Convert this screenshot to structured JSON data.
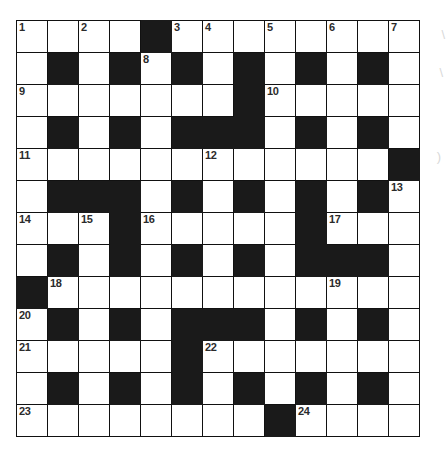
{
  "document": {
    "type": "crossword-puzzle-grid",
    "title": "Crossword Puzzle Grid",
    "rows": 13,
    "columns": 13,
    "colors": {
      "block": "#1a1a1a",
      "open": "#ffffff",
      "border": "#111111",
      "number": "#2b2b2b",
      "page": "#ffffff"
    }
  },
  "grid": {
    "legend": {
      "open": 0,
      "block": 1
    },
    "cells": [
      [
        0,
        0,
        0,
        0,
        1,
        0,
        0,
        0,
        0,
        0,
        0,
        0,
        0
      ],
      [
        0,
        1,
        0,
        1,
        0,
        1,
        0,
        1,
        0,
        1,
        0,
        1,
        0
      ],
      [
        0,
        0,
        0,
        0,
        0,
        0,
        0,
        1,
        0,
        0,
        0,
        0,
        0
      ],
      [
        0,
        1,
        0,
        1,
        0,
        1,
        1,
        1,
        0,
        1,
        0,
        1,
        0
      ],
      [
        0,
        0,
        0,
        0,
        0,
        0,
        0,
        0,
        0,
        0,
        0,
        0,
        1
      ],
      [
        0,
        1,
        1,
        1,
        0,
        1,
        0,
        1,
        0,
        1,
        0,
        1,
        0
      ],
      [
        0,
        0,
        0,
        1,
        0,
        0,
        0,
        0,
        0,
        1,
        0,
        0,
        0
      ],
      [
        0,
        1,
        0,
        1,
        0,
        1,
        0,
        1,
        0,
        1,
        1,
        1,
        0
      ],
      [
        1,
        0,
        0,
        0,
        0,
        0,
        0,
        0,
        0,
        0,
        0,
        0,
        0
      ],
      [
        0,
        1,
        0,
        1,
        0,
        1,
        1,
        1,
        0,
        1,
        0,
        1,
        0
      ],
      [
        0,
        0,
        0,
        0,
        0,
        1,
        0,
        0,
        0,
        0,
        0,
        0,
        0
      ],
      [
        0,
        1,
        0,
        1,
        0,
        1,
        0,
        1,
        0,
        1,
        0,
        1,
        0
      ],
      [
        0,
        0,
        0,
        0,
        0,
        0,
        0,
        0,
        1,
        0,
        0,
        0,
        0
      ]
    ],
    "numbers": [
      {
        "n": 1,
        "row": 1,
        "col": 1
      },
      {
        "n": 2,
        "row": 1,
        "col": 3
      },
      {
        "n": 3,
        "row": 1,
        "col": 6
      },
      {
        "n": 4,
        "row": 1,
        "col": 7
      },
      {
        "n": 5,
        "row": 1,
        "col": 9
      },
      {
        "n": 6,
        "row": 1,
        "col": 11
      },
      {
        "n": 7,
        "row": 1,
        "col": 13
      },
      {
        "n": 8,
        "row": 2,
        "col": 5
      },
      {
        "n": 9,
        "row": 3,
        "col": 1
      },
      {
        "n": 10,
        "row": 3,
        "col": 9
      },
      {
        "n": 11,
        "row": 5,
        "col": 1
      },
      {
        "n": 12,
        "row": 5,
        "col": 7
      },
      {
        "n": 13,
        "row": 6,
        "col": 13
      },
      {
        "n": 14,
        "row": 7,
        "col": 1
      },
      {
        "n": 15,
        "row": 7,
        "col": 3
      },
      {
        "n": 16,
        "row": 7,
        "col": 5
      },
      {
        "n": 17,
        "row": 7,
        "col": 11
      },
      {
        "n": 18,
        "row": 9,
        "col": 2
      },
      {
        "n": 19,
        "row": 9,
        "col": 11
      },
      {
        "n": 20,
        "row": 10,
        "col": 1
      },
      {
        "n": 21,
        "row": 11,
        "col": 1
      },
      {
        "n": 22,
        "row": 11,
        "col": 7
      },
      {
        "n": 23,
        "row": 13,
        "col": 1
      },
      {
        "n": 24,
        "row": 13,
        "col": 10
      }
    ]
  },
  "scan_artifacts": {
    "top_right_mark": "\\",
    "middle_right_mark": "\\",
    "bottom_right_mark": ")"
  }
}
